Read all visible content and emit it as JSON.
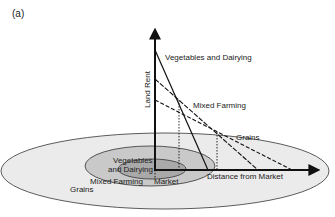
{
  "panel_label": "(a)",
  "axes": {
    "y_label": "Land Rent",
    "x_label": "Distance from Market"
  },
  "bid_rent_lines": [
    {
      "name": "Vegetables and Dairying",
      "style": "solid"
    },
    {
      "name": "Mixed Farming",
      "style": "dashed"
    },
    {
      "name": "Grains",
      "style": "long-dashed"
    }
  ],
  "zones": {
    "inner_line1": "Vegetables",
    "inner_line2": "and Dairying",
    "middle": "Mixed Farming",
    "outer": "Grains",
    "center": "Market"
  },
  "colors": {
    "outer_ring": "#ebebeb",
    "middle_ring": "#c9c9c9",
    "inner_ring": "#a9a9a9",
    "line": "#111111"
  }
}
